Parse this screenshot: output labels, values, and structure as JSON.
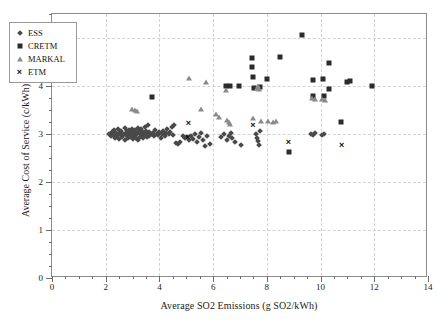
{
  "chart_data": {
    "type": "scatter",
    "title": "",
    "xlabel": "Average SO2 Emissions (g SO2/kWh)",
    "ylabel": "Average Cost of Service (c/kWh)",
    "xlim": [
      0,
      14
    ],
    "ylim": [
      0,
      5.5
    ],
    "xticks": [
      0,
      2,
      4,
      6,
      8,
      10,
      12,
      14
    ],
    "yticks": [
      0,
      1,
      2,
      3,
      4,
      5
    ],
    "xtick_labels": [
      "0",
      "2",
      "4",
      "6",
      "8",
      "10",
      "12",
      "14"
    ],
    "ytick_labels": [
      "0",
      "1",
      "2",
      "3",
      "4",
      "5"
    ],
    "x_minor_step": 0.5,
    "y_minor_step": 0.25,
    "grid": true,
    "grid_style": "dashed",
    "grid_color": "#d2d2d2",
    "legend_position": "top-left",
    "series": [
      {
        "name": "ESS",
        "marker": "diamond",
        "color": "#4a4a4a",
        "points": [
          [
            2.12,
            3.0
          ],
          [
            2.18,
            2.95
          ],
          [
            2.22,
            3.05
          ],
          [
            2.28,
            2.98
          ],
          [
            2.3,
            3.08
          ],
          [
            2.34,
            2.92
          ],
          [
            2.38,
            3.02
          ],
          [
            2.42,
            2.96
          ],
          [
            2.45,
            3.1
          ],
          [
            2.48,
            2.9
          ],
          [
            2.52,
            3.04
          ],
          [
            2.55,
            2.99
          ],
          [
            2.58,
            3.07
          ],
          [
            2.6,
            2.93
          ],
          [
            2.63,
            3.01
          ],
          [
            2.66,
            2.97
          ],
          [
            2.7,
            3.12
          ],
          [
            2.72,
            2.88
          ],
          [
            2.75,
            3.03
          ],
          [
            2.78,
            2.95
          ],
          [
            2.8,
            3.06
          ],
          [
            2.83,
            2.91
          ],
          [
            2.86,
            3.0
          ],
          [
            2.88,
            3.09
          ],
          [
            2.9,
            2.94
          ],
          [
            2.93,
            3.02
          ],
          [
            2.95,
            2.98
          ],
          [
            2.97,
            3.11
          ],
          [
            3.0,
            2.89
          ],
          [
            3.02,
            3.05
          ],
          [
            3.05,
            2.96
          ],
          [
            3.07,
            3.01
          ],
          [
            3.1,
            3.08
          ],
          [
            3.12,
            2.92
          ],
          [
            3.15,
            3.03
          ],
          [
            3.18,
            2.99
          ],
          [
            3.2,
            3.13
          ],
          [
            3.22,
            2.87
          ],
          [
            3.25,
            3.06
          ],
          [
            3.28,
            2.94
          ],
          [
            3.3,
            3.0
          ],
          [
            3.33,
            3.1
          ],
          [
            3.36,
            2.97
          ],
          [
            3.38,
            3.04
          ],
          [
            3.4,
            2.91
          ],
          [
            3.43,
            3.02
          ],
          [
            3.46,
            3.15
          ],
          [
            3.48,
            2.98
          ],
          [
            3.5,
            3.07
          ],
          [
            3.53,
            2.93
          ],
          [
            3.56,
            3.01
          ],
          [
            3.58,
            3.18
          ],
          [
            3.6,
            2.96
          ],
          [
            3.63,
            3.05
          ],
          [
            3.66,
            3.0
          ],
          [
            3.7,
            2.99
          ],
          [
            3.75,
            3.03
          ],
          [
            3.8,
            2.95
          ],
          [
            3.85,
            3.08
          ],
          [
            3.9,
            3.01
          ],
          [
            3.95,
            2.97
          ],
          [
            4.0,
            3.04
          ],
          [
            4.05,
            2.92
          ],
          [
            4.1,
            3.0
          ],
          [
            4.15,
            3.06
          ],
          [
            4.2,
            2.96
          ],
          [
            4.25,
            3.02
          ],
          [
            4.3,
            3.1
          ],
          [
            4.35,
            2.99
          ],
          [
            4.4,
            3.05
          ],
          [
            4.45,
            3.14
          ],
          [
            4.5,
            2.98
          ],
          [
            4.55,
            3.18
          ],
          [
            4.6,
            2.82
          ],
          [
            4.7,
            2.8
          ],
          [
            4.78,
            2.84
          ],
          [
            4.86,
            2.95
          ],
          [
            4.95,
            2.92
          ],
          [
            5.02,
            2.93
          ],
          [
            5.1,
            2.88
          ],
          [
            5.18,
            2.96
          ],
          [
            5.25,
            2.9
          ],
          [
            5.32,
            3.0
          ],
          [
            5.4,
            2.84
          ],
          [
            5.48,
            2.94
          ],
          [
            5.55,
            3.02
          ],
          [
            5.62,
            2.88
          ],
          [
            5.7,
            2.76
          ],
          [
            5.78,
            2.95
          ],
          [
            5.9,
            2.8
          ],
          [
            6.3,
            2.93
          ],
          [
            6.42,
            3.0
          ],
          [
            6.5,
            2.88
          ],
          [
            6.58,
            2.96
          ],
          [
            6.65,
            3.02
          ],
          [
            6.72,
            2.92
          ],
          [
            6.8,
            2.84
          ],
          [
            7.05,
            2.78
          ],
          [
            7.58,
            3.0
          ],
          [
            7.62,
            2.92
          ],
          [
            7.66,
            2.85
          ],
          [
            7.7,
            2.78
          ],
          [
            7.74,
            3.06
          ],
          [
            9.65,
            3.0
          ],
          [
            9.72,
            2.98
          ],
          [
            9.78,
            3.02
          ],
          [
            10.05,
            2.97
          ],
          [
            10.12,
            3.0
          ]
        ]
      },
      {
        "name": "CRETM",
        "marker": "square",
        "color": "#2b2b2b",
        "points": [
          [
            3.72,
            3.77
          ],
          [
            6.48,
            4.0
          ],
          [
            6.62,
            4.0
          ],
          [
            6.95,
            4.01
          ],
          [
            7.45,
            4.58
          ],
          [
            7.45,
            4.4
          ],
          [
            7.48,
            4.19
          ],
          [
            7.52,
            3.96
          ],
          [
            7.75,
            3.98
          ],
          [
            8.0,
            4.14
          ],
          [
            8.48,
            4.6
          ],
          [
            8.82,
            2.62
          ],
          [
            9.3,
            5.06
          ],
          [
            9.7,
            4.12
          ],
          [
            9.72,
            3.8
          ],
          [
            10.08,
            4.14
          ],
          [
            10.12,
            3.8
          ],
          [
            10.3,
            4.47
          ],
          [
            10.32,
            3.93
          ],
          [
            10.75,
            3.25
          ],
          [
            11.0,
            4.08
          ],
          [
            11.08,
            4.1
          ],
          [
            11.9,
            4.0
          ]
        ]
      },
      {
        "name": "MARKAL",
        "marker": "triangle",
        "color": "#8a8a8a",
        "points": [
          [
            2.98,
            3.52
          ],
          [
            3.1,
            3.5
          ],
          [
            3.18,
            3.48
          ],
          [
            5.1,
            4.17
          ],
          [
            5.55,
            3.53
          ],
          [
            5.72,
            4.08
          ],
          [
            6.1,
            3.42
          ],
          [
            6.2,
            3.36
          ],
          [
            6.48,
            3.92
          ],
          [
            6.52,
            3.3
          ],
          [
            6.58,
            3.24
          ],
          [
            6.62,
            3.2
          ],
          [
            7.48,
            3.33
          ],
          [
            7.62,
            3.96
          ],
          [
            7.68,
            3.99
          ],
          [
            7.72,
            3.94
          ],
          [
            7.8,
            3.28
          ],
          [
            8.05,
            3.27
          ],
          [
            8.22,
            3.26
          ],
          [
            8.35,
            3.27
          ],
          [
            9.68,
            3.74
          ],
          [
            9.78,
            3.72
          ],
          [
            10.05,
            3.73
          ],
          [
            10.15,
            3.7
          ]
        ]
      },
      {
        "name": "ETM",
        "marker": "cross",
        "color": "#111111",
        "points": [
          [
            5.08,
            3.22
          ],
          [
            5.05,
            2.93
          ],
          [
            7.48,
            3.19
          ],
          [
            8.8,
            2.83
          ],
          [
            10.78,
            2.78
          ]
        ]
      }
    ]
  },
  "legend": {
    "items": [
      {
        "label": "ESS",
        "marker": "diamond"
      },
      {
        "label": "CRETM",
        "marker": "square"
      },
      {
        "label": "MARKAL",
        "marker": "triangle"
      },
      {
        "label": "ETM",
        "marker": "cross"
      }
    ]
  }
}
